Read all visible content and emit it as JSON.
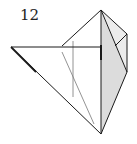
{
  "diagram": {
    "type": "origami-fold-step",
    "step_number": "12",
    "colors": {
      "line": "#1a1a1a",
      "fold_line": "#777777",
      "shade": "#dcdcdc",
      "shade_light": "#ececec"
    }
  }
}
